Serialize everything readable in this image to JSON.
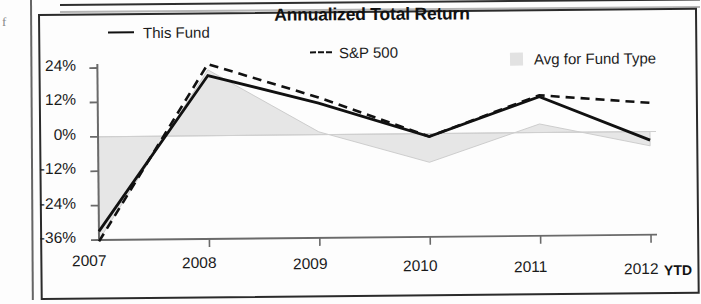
{
  "chart_data": {
    "type": "line",
    "title": "Annualized Total Return",
    "xlabel": "",
    "ylabel": "",
    "x": [
      "2007",
      "2008",
      "2009",
      "2010",
      "2011",
      "2012"
    ],
    "x_suffix_label": "YTD",
    "ylim": [
      -36,
      24
    ],
    "yticks": [
      24,
      12,
      0,
      -12,
      -24,
      -36
    ],
    "ytick_labels": [
      "24%",
      "12%",
      "0%",
      "-12%",
      "-24%",
      "-36%"
    ],
    "grid": false,
    "legend_position": "top",
    "series": [
      {
        "name": "This Fund",
        "style": "solid",
        "color": "#111111",
        "values": [
          -33,
          21,
          11,
          -1,
          12.5,
          -3
        ]
      },
      {
        "name": "S&P 500",
        "style": "dashed",
        "color": "#111111",
        "values": [
          -36.5,
          25,
          13,
          -1,
          13,
          10
        ]
      },
      {
        "name": "Avg for Fund Type",
        "style": "area",
        "color": "#d8d8d8",
        "values": [
          -36,
          23,
          1,
          -10,
          3,
          -5
        ]
      }
    ]
  },
  "legend": {
    "items": [
      {
        "label": "This Fund",
        "swatch": "solid-line-swatch"
      },
      {
        "label": "S&P 500",
        "swatch": "dashed-line-swatch"
      },
      {
        "label": "Avg for Fund Type",
        "swatch": "area-fill-swatch"
      }
    ]
  },
  "page": {
    "margin_glyph": "f"
  }
}
